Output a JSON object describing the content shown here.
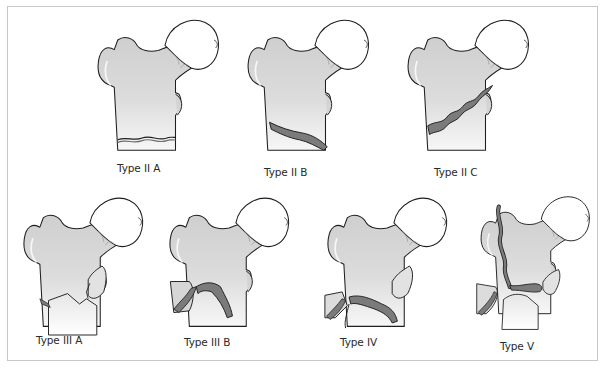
{
  "diagram": {
    "colors": {
      "bone_fill": "#d9d9d9",
      "bone_highlight": "#f4f4f4",
      "fracture_band": "#7b7b7b",
      "outline": "#1e1e1e",
      "frame_border": "#c8c8c8",
      "label_text": "#2a2a2a"
    },
    "rows": [
      {
        "figures": [
          {
            "id": "type-2a",
            "label": "Type II A"
          },
          {
            "id": "type-2b",
            "label": "Type II B"
          },
          {
            "id": "type-2c",
            "label": "Type II C"
          }
        ]
      },
      {
        "figures": [
          {
            "id": "type-3a",
            "label": "Type III A"
          },
          {
            "id": "type-3b",
            "label": "Type III B"
          },
          {
            "id": "type-4",
            "label": "Type IV"
          },
          {
            "id": "type-5",
            "label": "Type V"
          }
        ]
      }
    ]
  }
}
